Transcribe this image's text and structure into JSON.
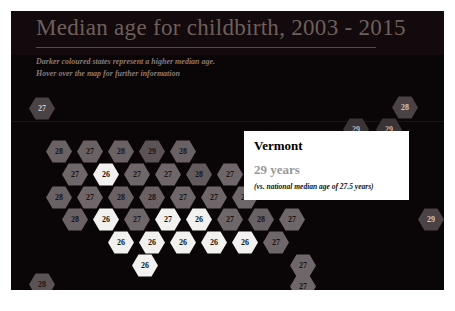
{
  "chart_data": {
    "type": "heatmap",
    "title": "Median age for childbirth, 2003 - 2015",
    "subtitle_lines": [
      "Darker coloured states represent a higher median age.",
      "Hover over the map for further information"
    ],
    "xlabel": "",
    "ylabel": "",
    "legend": [],
    "grid": false,
    "value_unit": "years",
    "national_median": 27.5,
    "value_range": [
      26,
      29
    ],
    "tiles": [
      {
        "value": 27,
        "x": 18,
        "y": 86,
        "shade": "#4a4244",
        "text": "#cfc8c6"
      },
      {
        "value": 28,
        "x": 381,
        "y": 85,
        "shade": "#4a4244",
        "text": "#cfc8c6"
      },
      {
        "value": 29,
        "x": 332,
        "y": 107,
        "shade": "#3b3436",
        "text": "#bdb6b4"
      },
      {
        "value": 29,
        "x": 365,
        "y": 107,
        "shade": "#3b3436",
        "text": "#bdb6b4"
      },
      {
        "value": 28,
        "x": 35,
        "y": 129,
        "shade": "#6a6164",
        "text": "#181414"
      },
      {
        "value": 27,
        "x": 66,
        "y": 129,
        "shade": "#6a6164",
        "text": "#181414"
      },
      {
        "value": 28,
        "x": 97,
        "y": 129,
        "shade": "#6a6164",
        "text": "#181414"
      },
      {
        "value": 29,
        "x": 128,
        "y": 129,
        "shade": "#5b5355",
        "text": "#1a1616"
      },
      {
        "value": 28,
        "x": 159,
        "y": 129,
        "shade": "#6a6164",
        "text": "#181414"
      },
      {
        "value": 27,
        "x": 51,
        "y": 152,
        "shade": "#6f6669",
        "text": "#171313"
      },
      {
        "value": 26,
        "x": 82,
        "y": 152,
        "shade": "#f2f1ef",
        "text": "#111111"
      },
      {
        "value": 27,
        "x": 113,
        "y": 152,
        "shade": "#6f6669",
        "text": "#171313"
      },
      {
        "value": 27,
        "x": 144,
        "y": 152,
        "shade": "#6f6669",
        "text": "#171313"
      },
      {
        "value": 28,
        "x": 175,
        "y": 152,
        "shade": "#625a5c",
        "text": "#171313"
      },
      {
        "value": 27,
        "x": 206,
        "y": 152,
        "shade": "#6f6669",
        "text": "#171313"
      },
      {
        "value": 27,
        "x": 237,
        "y": 152,
        "shade": "#6f6669",
        "text": "#171313"
      },
      {
        "value": 28,
        "x": 35,
        "y": 175,
        "shade": "#6a6164",
        "text": "#181414"
      },
      {
        "value": 27,
        "x": 66,
        "y": 175,
        "shade": "#6f6669",
        "text": "#171313"
      },
      {
        "value": 28,
        "x": 97,
        "y": 175,
        "shade": "#6a6164",
        "text": "#181414"
      },
      {
        "value": 28,
        "x": 128,
        "y": 175,
        "shade": "#6a6164",
        "text": "#181414"
      },
      {
        "value": 27,
        "x": 159,
        "y": 175,
        "shade": "#6f6669",
        "text": "#171313"
      },
      {
        "value": 27,
        "x": 190,
        "y": 175,
        "shade": "#6f6669",
        "text": "#171313"
      },
      {
        "value": 27,
        "x": 221,
        "y": 175,
        "shade": "#6f6669",
        "text": "#171313"
      },
      {
        "value": 28,
        "x": 51,
        "y": 197,
        "shade": "#6a6164",
        "text": "#181414"
      },
      {
        "value": 26,
        "x": 82,
        "y": 197,
        "shade": "#f2f1ef",
        "text": "#111111"
      },
      {
        "value": 27,
        "x": 113,
        "y": 197,
        "shade": "#6f6669",
        "text": "#171313"
      },
      {
        "value": 27,
        "x": 144,
        "y": 197,
        "shade": "#f2f1ef",
        "text": "#111111"
      },
      {
        "value": 26,
        "x": 175,
        "y": 197,
        "shade": "#f2f1ef",
        "text": "#111111"
      },
      {
        "value": 27,
        "x": 206,
        "y": 197,
        "shade": "#6f6669",
        "text": "#171313"
      },
      {
        "value": 28,
        "x": 237,
        "y": 197,
        "shade": "#6a6164",
        "text": "#181414"
      },
      {
        "value": 27,
        "x": 268,
        "y": 197,
        "shade": "#6f6669",
        "text": "#171313"
      },
      {
        "value": 29,
        "x": 407,
        "y": 197,
        "shade": "#4a4244",
        "text": "#cfc8c6"
      },
      {
        "value": 26,
        "x": 97,
        "y": 220,
        "shade": "#f2f1ef",
        "text": "#111111"
      },
      {
        "value": 26,
        "x": 128,
        "y": 220,
        "shade": "#f2f1ef",
        "text": "#111111"
      },
      {
        "value": 26,
        "x": 159,
        "y": 220,
        "shade": "#f2f1ef",
        "text": "#111111"
      },
      {
        "value": 26,
        "x": 190,
        "y": 220,
        "shade": "#f2f1ef",
        "text": "#111111"
      },
      {
        "value": 26,
        "x": 221,
        "y": 220,
        "shade": "#f2f1ef",
        "text": "#111111"
      },
      {
        "value": 27,
        "x": 252,
        "y": 220,
        "shade": "#6f6669",
        "text": "#171313"
      },
      {
        "value": 26,
        "x": 121,
        "y": 243,
        "shade": "#f2f1ef",
        "text": "#111111"
      },
      {
        "value": 27,
        "x": 279,
        "y": 243,
        "shade": "#6f6669",
        "text": "#171313"
      },
      {
        "value": 28,
        "x": 18,
        "y": 262,
        "shade": "#5b5355",
        "text": "#1d1818"
      },
      {
        "value": 27,
        "x": 279,
        "y": 264,
        "shade": "#6f6669",
        "text": "#171313"
      }
    ]
  },
  "tooltip": {
    "state": "Vermont",
    "value_text": "29 years",
    "comparison": "(vs. national median age of 27.5 years)"
  }
}
